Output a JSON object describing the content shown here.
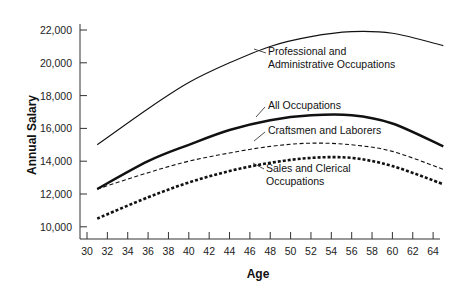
{
  "chart_data": {
    "type": "line",
    "title": "",
    "xlabel": "Age",
    "ylabel": "Annual Salary",
    "xlim": [
      30,
      65
    ],
    "ylim": [
      9300,
      22000
    ],
    "x_ticks": [
      30,
      32,
      34,
      36,
      38,
      40,
      42,
      44,
      46,
      48,
      50,
      52,
      54,
      56,
      58,
      60,
      62,
      64
    ],
    "y_ticks": [
      10000,
      12000,
      14000,
      16000,
      18000,
      20000,
      22000
    ],
    "y_tick_labels": [
      "10,000",
      "12,000",
      "14,000",
      "16,000",
      "18,000",
      "20,000",
      "22,000"
    ],
    "grid": false,
    "legend": "inline labels with leader lines",
    "x": [
      31,
      36,
      40,
      44,
      48,
      52,
      56,
      60,
      65
    ],
    "series": [
      {
        "name": "Professional and Administrative Occupations",
        "label_lines": [
          "Professional and",
          "Administrative Occupations"
        ],
        "style": "thin-solid",
        "values": [
          15000,
          17200,
          18800,
          20000,
          21000,
          21600,
          21900,
          21800,
          21050
        ]
      },
      {
        "name": "All Occupations",
        "label_lines": [
          "All Occupations"
        ],
        "style": "thick-solid",
        "values": [
          12300,
          14000,
          15000,
          15900,
          16500,
          16800,
          16800,
          16300,
          14900
        ]
      },
      {
        "name": "Craftsmen and Laborers",
        "label_lines": [
          "Craftsmen and Laborers"
        ],
        "style": "thin-dashed",
        "values": [
          12300,
          13300,
          14000,
          14500,
          14900,
          15100,
          15000,
          14600,
          13500
        ]
      },
      {
        "name": "Sales and Clerical Occupations",
        "label_lines": [
          "Sales and Clerical",
          "Occupations"
        ],
        "style": "thick-dashed",
        "values": [
          10500,
          11800,
          12700,
          13400,
          13900,
          14200,
          14200,
          13700,
          12600
        ]
      }
    ]
  }
}
